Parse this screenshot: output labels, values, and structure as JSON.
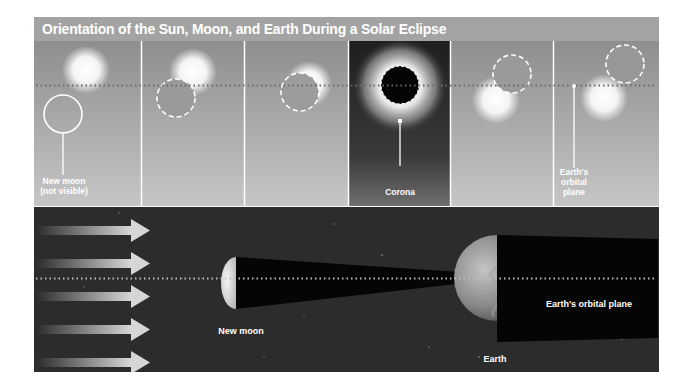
{
  "title": "Orientation of the Sun, Moon, and Earth During a Solar Eclipse",
  "colors": {
    "title_bg": "#a3a3a3",
    "panel_bg_top": "#8f8f8f",
    "panel_bg_bottom": "#c4c4c4",
    "corona_panel_bg": "#2a2a2a",
    "space_bg": "#2b2b2b",
    "shadow": "#050505",
    "label": "#ffffff",
    "dotted_line": "#6d6d6d"
  },
  "top_row": {
    "panels": [
      {
        "index": 1,
        "moon_offset": "below-left",
        "label": "New moon\n(not visible)"
      },
      {
        "index": 2,
        "moon_offset": "partial lower-left",
        "label": ""
      },
      {
        "index": 3,
        "moon_offset": "mostly covering",
        "label": ""
      },
      {
        "index": 4,
        "moon_offset": "total",
        "label": "Corona"
      },
      {
        "index": 5,
        "moon_offset": "mostly covering upper-right",
        "label": ""
      },
      {
        "index": 6,
        "moon_offset": "partial upper-right",
        "label": "Earth's\norbital\nplane"
      }
    ],
    "labels": {
      "new_moon_line1": "New moon",
      "new_moon_line2": "(not visible)",
      "corona": "Corona",
      "orbital_line1": "Earth's",
      "orbital_line2": "orbital",
      "orbital_line3": "plane"
    }
  },
  "bottom_row": {
    "sunlight_arrows": 5,
    "labels": {
      "new_moon": "New moon",
      "earth": "Earth",
      "orbital_plane": "Earth's orbital plane"
    }
  }
}
